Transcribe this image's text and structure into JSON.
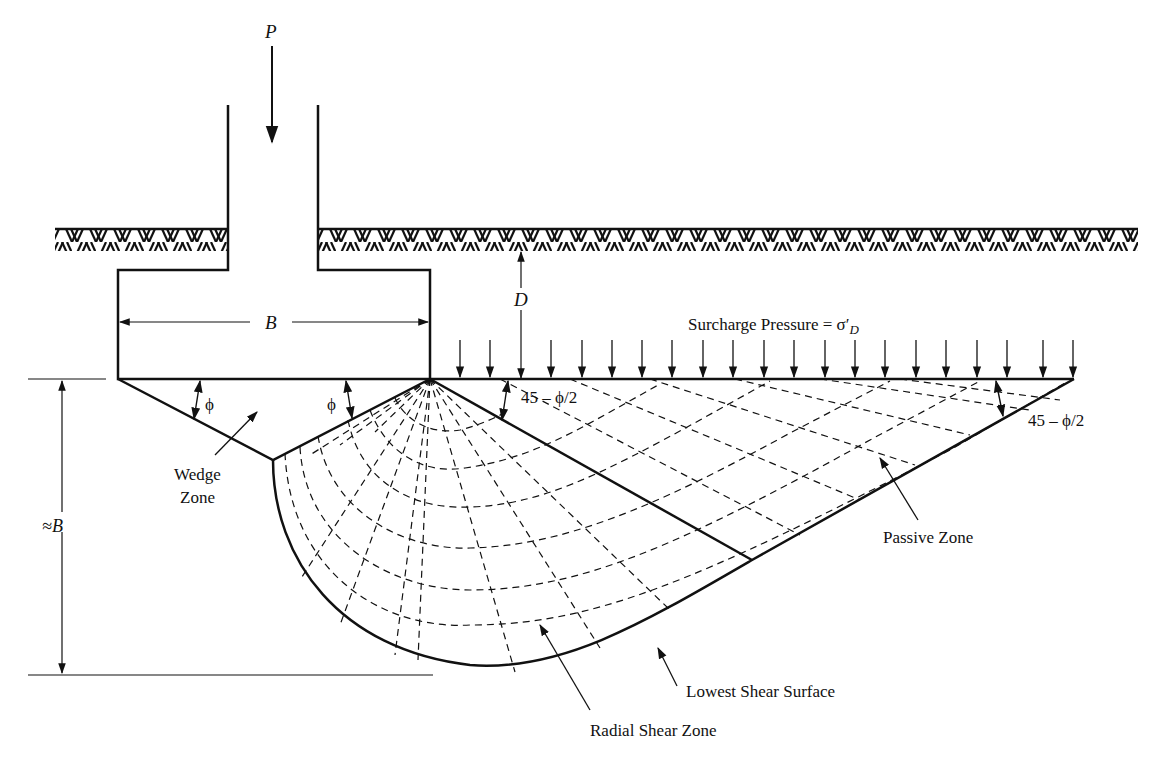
{
  "figure": {
    "load_label": "P",
    "width_label": "B",
    "depth_label": "D",
    "depth_approx_label": "≈B",
    "surcharge_label": "Surcharge Pressure = σ′",
    "surcharge_subscript": "D",
    "angle_phi_left": "ϕ",
    "angle_phi_right": "ϕ",
    "angle_passive_inner": "45 – ϕ/2",
    "angle_passive_outer": "45 – ϕ/2",
    "zones": {
      "wedge_line1": "Wedge",
      "wedge_line2": "Zone",
      "passive": "Passive Zone",
      "radial": "Radial Shear Zone",
      "lowest_surface": "Lowest Shear Surface"
    }
  },
  "colors": {
    "ink": "#111111",
    "background": "#ffffff"
  }
}
